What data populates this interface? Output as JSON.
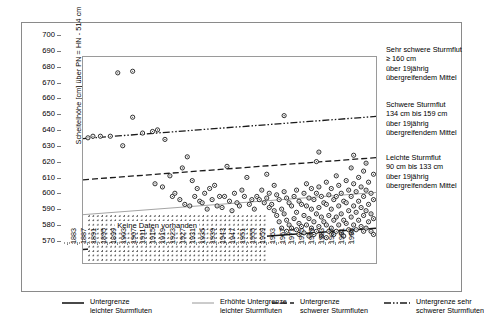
{
  "axes": {
    "ylabel": "Scheitelhöhe [cm] über PN = HN - 514 cm",
    "yticks": [
      700,
      690,
      680,
      670,
      660,
      650,
      640,
      630,
      620,
      610,
      600,
      590,
      580,
      570
    ],
    "ylim": [
      570,
      700
    ],
    "xticks": [
      1883,
      1887,
      1891,
      1895,
      1899,
      1903,
      1907,
      1911,
      1915,
      1919,
      1923,
      1927,
      1931,
      1935,
      1939,
      1943,
      1947,
      1951,
      1955,
      1959,
      1963,
      1967,
      1971,
      1975,
      1979,
      1983,
      1987,
      1991,
      1995
    ],
    "xlim": [
      1881,
      1999
    ]
  },
  "nodata": {
    "label": "Keine Daten vorhanden"
  },
  "annotations": [
    {
      "title": "Sehr schwere Sturmflut",
      "range": "≥ 160 cm",
      "line3": "über 19jährig",
      "line4": "übergreifendem Mittel"
    },
    {
      "title": "Schwere Sturmflut",
      "range": "134 cm bis 159 cm",
      "line3": "über 19jährig",
      "line4": "übergreifendem Mittel"
    },
    {
      "title": "Leichte Sturmflut",
      "range": "90 cm bis 133 cm",
      "line3": "über 19jährig",
      "line4": "übergreifendem Mittel"
    }
  ],
  "legend": [
    {
      "style": "solid",
      "line1": "Untergrenze",
      "line2": "leichter Sturmfluten"
    },
    {
      "style": "thin",
      "line1": "Erhöhte Untergrenze",
      "line2": "leichter Sturmfluten"
    },
    {
      "style": "dashed",
      "line1": "Untergrenze",
      "line2": "schwerer Sturmfluten"
    },
    {
      "style": "dashdotdot",
      "line1": "Untergrenze sehr",
      "line2": "schwerer Sturmfluten"
    }
  ],
  "colors": {
    "ink": "#1a1a1a",
    "frame": "#9a9a9a",
    "thin": "#8d8d8d"
  },
  "chart_data": {
    "type": "scatter",
    "title": "",
    "xlabel": "",
    "ylabel": "Scheitelhöhe [cm] über PN = HN - 514 cm",
    "xlim": [
      1881,
      1999
    ],
    "ylim": [
      570,
      700
    ],
    "grid": false,
    "legend_position": "bottom",
    "series": [
      {
        "name": "Sturmflut-Scheitelhöhen",
        "marker": "circle-open",
        "points": [
          [
            1883,
            649
          ],
          [
            1885,
            650
          ],
          [
            1888,
            650
          ],
          [
            1892,
            650
          ],
          [
            1895,
            690
          ],
          [
            1897,
            644
          ],
          [
            1901,
            691
          ],
          [
            1901,
            662
          ],
          [
            1905,
            652
          ],
          [
            1909,
            653
          ],
          [
            1910,
            620
          ],
          [
            1911,
            654
          ],
          [
            1913,
            618
          ],
          [
            1914,
            648
          ],
          [
            1916,
            625
          ],
          [
            1917,
            612
          ],
          [
            1918,
            614
          ],
          [
            1920,
            610
          ],
          [
            1921,
            630
          ],
          [
            1922,
            607
          ],
          [
            1923,
            637
          ],
          [
            1924,
            606
          ],
          [
            1925,
            622
          ],
          [
            1926,
            612
          ],
          [
            1927,
            617
          ],
          [
            1928,
            609
          ],
          [
            1929,
            608
          ],
          [
            1930,
            614
          ],
          [
            1931,
            604
          ],
          [
            1932,
            617
          ],
          [
            1933,
            610
          ],
          [
            1934,
            619
          ],
          [
            1935,
            606
          ],
          [
            1936,
            612
          ],
          [
            1937,
            605
          ],
          [
            1938,
            612
          ],
          [
            1939,
            631
          ],
          [
            1940,
            609
          ],
          [
            1941,
            603
          ],
          [
            1942,
            614
          ],
          [
            1943,
            608
          ],
          [
            1944,
            606
          ],
          [
            1945,
            616
          ],
          [
            1946,
            612
          ],
          [
            1947,
            624
          ],
          [
            1948,
            607
          ],
          [
            1949,
            610
          ],
          [
            1950,
            604
          ],
          [
            1951,
            612
          ],
          [
            1952,
            610
          ],
          [
            1953,
            616
          ],
          [
            1954,
            608
          ],
          [
            1955,
            626
          ],
          [
            1955,
            611
          ],
          [
            1956,
            605
          ],
          [
            1956,
            614
          ],
          [
            1957,
            607
          ],
          [
            1958,
            619
          ],
          [
            1958,
            603
          ],
          [
            1959,
            613
          ],
          [
            1959,
            600
          ],
          [
            1960,
            610
          ],
          [
            1960,
            596
          ],
          [
            1961,
            604
          ],
          [
            1961,
            592
          ],
          [
            1962,
            663
          ],
          [
            1962,
            615
          ],
          [
            1962,
            601
          ],
          [
            1963,
            611
          ],
          [
            1963,
            597
          ],
          [
            1963,
            590
          ],
          [
            1964,
            608
          ],
          [
            1964,
            594
          ],
          [
            1965,
            606
          ],
          [
            1965,
            592
          ],
          [
            1966,
            612
          ],
          [
            1966,
            598
          ],
          [
            1967,
            616
          ],
          [
            1967,
            602
          ],
          [
            1967,
            591
          ],
          [
            1968,
            609
          ],
          [
            1968,
            595
          ],
          [
            1968,
            588
          ],
          [
            1969,
            607
          ],
          [
            1969,
            593
          ],
          [
            1970,
            614
          ],
          [
            1970,
            600
          ],
          [
            1970,
            589
          ],
          [
            1971,
            620
          ],
          [
            1971,
            606
          ],
          [
            1971,
            594
          ],
          [
            1972,
            611
          ],
          [
            1972,
            598
          ],
          [
            1972,
            587
          ],
          [
            1973,
            617
          ],
          [
            1973,
            604
          ],
          [
            1973,
            592
          ],
          [
            1974,
            610
          ],
          [
            1974,
            596
          ],
          [
            1974,
            588
          ],
          [
            1975,
            634
          ],
          [
            1975,
            614
          ],
          [
            1975,
            601
          ],
          [
            1975,
            590
          ],
          [
            1976,
            640
          ],
          [
            1976,
            618
          ],
          [
            1976,
            605
          ],
          [
            1976,
            593
          ],
          [
            1977,
            612
          ],
          [
            1977,
            599
          ],
          [
            1977,
            587
          ],
          [
            1978,
            608
          ],
          [
            1978,
            596
          ],
          [
            1979,
            621
          ],
          [
            1979,
            607
          ],
          [
            1979,
            594
          ],
          [
            1979,
            586
          ],
          [
            1980,
            613
          ],
          [
            1980,
            600
          ],
          [
            1980,
            590
          ],
          [
            1981,
            617
          ],
          [
            1981,
            604
          ],
          [
            1981,
            592
          ],
          [
            1982,
            610
          ],
          [
            1982,
            597
          ],
          [
            1982,
            588
          ],
          [
            1983,
            625
          ],
          [
            1983,
            612
          ],
          [
            1983,
            599
          ],
          [
            1983,
            590
          ],
          [
            1984,
            619
          ],
          [
            1984,
            606
          ],
          [
            1984,
            594
          ],
          [
            1985,
            614
          ],
          [
            1985,
            601
          ],
          [
            1985,
            589
          ],
          [
            1986,
            609
          ],
          [
            1986,
            597
          ],
          [
            1986,
            587
          ],
          [
            1987,
            622
          ],
          [
            1987,
            608
          ],
          [
            1987,
            595
          ],
          [
            1988,
            616
          ],
          [
            1988,
            603
          ],
          [
            1988,
            591
          ],
          [
            1989,
            630
          ],
          [
            1989,
            612
          ],
          [
            1989,
            599
          ],
          [
            1989,
            589
          ],
          [
            1990,
            638
          ],
          [
            1990,
            620
          ],
          [
            1990,
            606
          ],
          [
            1990,
            594
          ],
          [
            1991,
            615
          ],
          [
            1991,
            602
          ],
          [
            1991,
            591
          ],
          [
            1992,
            624
          ],
          [
            1992,
            609
          ],
          [
            1992,
            597
          ],
          [
            1993,
            618
          ],
          [
            1993,
            605
          ],
          [
            1993,
            593
          ],
          [
            1994,
            628
          ],
          [
            1994,
            612
          ],
          [
            1994,
            600
          ],
          [
            1994,
            590
          ],
          [
            1995,
            633
          ],
          [
            1995,
            616
          ],
          [
            1995,
            603
          ],
          [
            1995,
            592
          ],
          [
            1996,
            621
          ],
          [
            1996,
            607
          ],
          [
            1996,
            596
          ],
          [
            1997,
            614
          ],
          [
            1997,
            601
          ],
          [
            1997,
            590
          ],
          [
            1998,
            626
          ],
          [
            1998,
            610
          ],
          [
            1998,
            598
          ],
          [
            1998,
            588
          ]
        ]
      }
    ],
    "trend_lines": [
      {
        "name": "Untergrenze leichter Sturmfluten",
        "style": "solid",
        "x": [
          1881,
          1999
        ],
        "y": [
          578.5,
          592.0
        ]
      },
      {
        "name": "Erhöhte Untergrenze leichter Sturmfluten",
        "style": "thin",
        "x": [
          1881,
          1999
        ],
        "y": [
          600.5,
          614.5
        ]
      },
      {
        "name": "Untergrenze schwerer Sturmfluten",
        "style": "dashed",
        "x": [
          1881,
          1999
        ],
        "y": [
          622.5,
          636.5
        ]
      },
      {
        "name": "Untergrenze sehr schwerer Sturmfluten",
        "style": "dashdotdot",
        "x": [
          1881,
          1999
        ],
        "y": [
          648.5,
          662.5
        ]
      }
    ],
    "shaded_region": {
      "label": "Keine Daten vorhanden",
      "x_range": [
        1883,
        1955
      ],
      "y_range": [
        570,
        600
      ]
    }
  }
}
